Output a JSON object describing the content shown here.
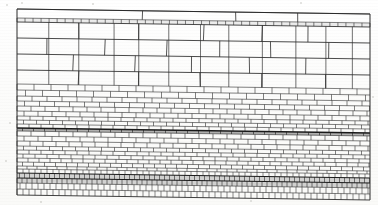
{
  "figure": {
    "title": "Masonry wall elevation",
    "medium": "line drawing on paper (scanned)",
    "line_color": "#2b2b2b",
    "accent_dark_color": "#1a1a1a",
    "paper_color": "#fdfdfc",
    "frame": {
      "x": 17,
      "y": 8,
      "width": 353,
      "height": 188
    }
  },
  "geometry": {
    "left_x": 17,
    "right_x": 370,
    "slope_drop_px": 5,
    "note": "Every course line drops by slope_drop_px from left edge to right edge."
  },
  "courses": [
    {
      "id": "course-cap-top",
      "label": "Capping band (thin)",
      "y_left": 9,
      "height": 9,
      "joints": [
        0.0,
        0.355,
        0.62,
        0.795,
        1.0
      ],
      "style": "plain"
    },
    {
      "id": "course-dentil",
      "label": "Thin dentil / tile string course",
      "y_left": 18,
      "height": 4,
      "unit_count": 44,
      "style": "dentil"
    },
    {
      "id": "course-ashlar-1",
      "label": "Large ashlar course 1",
      "y_left": 22,
      "height": 16,
      "joints": [
        0.0,
        0.175,
        0.345,
        0.53,
        0.695,
        0.825,
        1.0
      ],
      "style": "plain"
    },
    {
      "id": "course-ashlar-2",
      "label": "Large ashlar course 2",
      "y_left": 38,
      "height": 16,
      "joints": [
        0.0,
        0.085,
        0.25,
        0.425,
        0.575,
        0.72,
        0.885,
        1.0
      ],
      "style": "plain"
    },
    {
      "id": "course-ashlar-3",
      "label": "Large ashlar course 3",
      "y_left": 54,
      "height": 16,
      "joints": [
        0.0,
        0.16,
        0.335,
        0.495,
        0.66,
        0.82,
        1.0
      ],
      "style": "plain"
    },
    {
      "id": "course-ashlar-4",
      "label": "Large ashlar course 4",
      "y_left": 70,
      "height": 14,
      "joints": [
        0.0,
        0.175,
        0.345,
        0.52,
        0.695,
        0.875,
        1.0
      ],
      "style": "plain"
    },
    {
      "id": "course-brick-1",
      "label": "Brick course, large",
      "y_left": 84,
      "height": 6,
      "unit_width": 17,
      "offset": 0.0,
      "style": "brick"
    },
    {
      "id": "course-brick-2",
      "label": "Brick course, large",
      "y_left": 90,
      "height": 6,
      "unit_width": 17,
      "offset": 0.5,
      "style": "brick"
    },
    {
      "id": "course-brick-3",
      "label": "Brick course",
      "y_left": 96,
      "height": 5,
      "unit_width": 15,
      "offset": 0.0,
      "style": "brick"
    },
    {
      "id": "course-brick-4",
      "label": "Brick course",
      "y_left": 101,
      "height": 5,
      "unit_width": 15,
      "offset": 0.5,
      "style": "brick"
    },
    {
      "id": "course-brick-5",
      "label": "Brick course",
      "y_left": 106,
      "height": 5,
      "unit_width": 14,
      "offset": 0.0,
      "style": "brick"
    },
    {
      "id": "course-brick-6",
      "label": "Brick course",
      "y_left": 111,
      "height": 5,
      "unit_width": 14,
      "offset": 0.5,
      "style": "brick"
    },
    {
      "id": "course-brick-7",
      "label": "Brick course",
      "y_left": 116,
      "height": 4,
      "unit_width": 13,
      "offset": 0.0,
      "style": "brick"
    },
    {
      "id": "course-brick-8",
      "label": "Brick course",
      "y_left": 120,
      "height": 4,
      "unit_width": 13,
      "offset": 0.5,
      "style": "brick"
    },
    {
      "id": "course-brick-9",
      "label": "Brick course",
      "y_left": 124,
      "height": 4,
      "unit_width": 12,
      "offset": 0.0,
      "style": "brick"
    },
    {
      "id": "course-dark-band",
      "label": "Dark emphasised bedding joint",
      "y_left": 128,
      "height": 3,
      "unit_width": 11,
      "offset": 0.5,
      "style": "dark-band"
    },
    {
      "id": "course-brick-10",
      "label": "Brick course",
      "y_left": 131,
      "height": 5,
      "unit_width": 14,
      "offset": 0.0,
      "style": "brick"
    },
    {
      "id": "course-brick-11",
      "label": "Brick course",
      "y_left": 136,
      "height": 5,
      "unit_width": 14,
      "offset": 0.5,
      "style": "brick"
    },
    {
      "id": "course-brick-12",
      "label": "Brick course",
      "y_left": 141,
      "height": 5,
      "unit_width": 13,
      "offset": 0.0,
      "style": "brick"
    },
    {
      "id": "course-brick-13",
      "label": "Brick course",
      "y_left": 146,
      "height": 4,
      "unit_width": 13,
      "offset": 0.5,
      "style": "brick"
    },
    {
      "id": "course-brick-14",
      "label": "Brick course",
      "y_left": 150,
      "height": 4,
      "unit_width": 12,
      "offset": 0.0,
      "style": "brick"
    },
    {
      "id": "course-brick-15",
      "label": "Brick course",
      "y_left": 154,
      "height": 4,
      "unit_width": 12,
      "offset": 0.5,
      "style": "brick"
    },
    {
      "id": "course-brick-16",
      "label": "Brick course",
      "y_left": 158,
      "height": 4,
      "unit_width": 11,
      "offset": 0.0,
      "style": "brick"
    },
    {
      "id": "course-brick-17",
      "label": "Brick course",
      "y_left": 162,
      "height": 4,
      "unit_width": 11,
      "offset": 0.5,
      "style": "brick"
    },
    {
      "id": "course-brick-18",
      "label": "Brick course, fine",
      "y_left": 166,
      "height": 3,
      "unit_width": 10,
      "offset": 0.0,
      "style": "brick"
    },
    {
      "id": "course-tile-1",
      "label": "Small tile course",
      "y_left": 169,
      "height": 4,
      "unit_width": 6,
      "offset": 0.0,
      "style": "tile"
    },
    {
      "id": "course-tile-dark",
      "label": "Dark small-tile band",
      "y_left": 173,
      "height": 5,
      "unit_width": 5,
      "offset": 0.5,
      "style": "tile-dark"
    },
    {
      "id": "course-tile-2",
      "label": "Small tile course",
      "y_left": 178,
      "height": 5,
      "unit_width": 5,
      "offset": 0.0,
      "style": "tile-dark"
    },
    {
      "id": "course-tile-3",
      "label": "Small tile course",
      "y_left": 183,
      "height": 6,
      "unit_width": 6,
      "offset": 0.5,
      "style": "tile"
    },
    {
      "id": "course-tile-4",
      "label": "Small tile course, base",
      "y_left": 189,
      "height": 6,
      "unit_width": 6,
      "offset": 0.0,
      "style": "tile"
    }
  ],
  "upper_verticals": {
    "label": "Tall perpend joints rising through the upper block courses",
    "positions": [
      0.09,
      0.175,
      0.275,
      0.345,
      0.43,
      0.52,
      0.6,
      0.695,
      0.79,
      0.875,
      0.95
    ]
  },
  "specks": [
    {
      "x": 6,
      "y": 4,
      "r": 1.2
    },
    {
      "x": 21,
      "y": 2,
      "r": 0.9
    },
    {
      "x": 92,
      "y": 3,
      "r": 0.8
    },
    {
      "x": 300,
      "y": 2,
      "r": 1.0
    },
    {
      "x": 9,
      "y": 122,
      "r": 1.1
    },
    {
      "x": 5,
      "y": 160,
      "r": 0.9
    },
    {
      "x": 372,
      "y": 96,
      "r": 1.0
    },
    {
      "x": 40,
      "y": 201,
      "r": 0.8
    },
    {
      "x": 250,
      "y": 200,
      "r": 1.0
    }
  ]
}
